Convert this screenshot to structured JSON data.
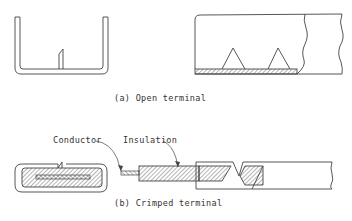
{
  "figure": {
    "panel_a": {
      "caption": "(a) Open terminal",
      "parts": [
        "open-channel-end-view",
        "open-terminal-side-view"
      ]
    },
    "panel_b": {
      "caption": "(b) Crimped terminal",
      "labels": {
        "conductor": "Conductor",
        "insulation": "Insulation"
      },
      "parts": [
        "crimped-end-view",
        "crimped-side-view"
      ]
    }
  },
  "colors": {
    "line": "#444444",
    "background": "#ffffff"
  }
}
